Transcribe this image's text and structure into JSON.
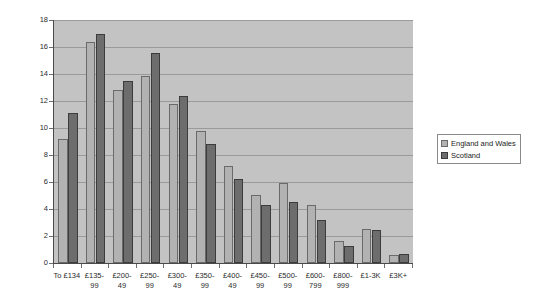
{
  "chart_data": {
    "type": "bar",
    "title": "",
    "xlabel": "",
    "ylabel": "Percentage",
    "ylim": [
      0,
      18
    ],
    "ytick_step": 2,
    "yticks": [
      0,
      2,
      4,
      6,
      8,
      10,
      12,
      14,
      16,
      18
    ],
    "grid": true,
    "legend_position": "right",
    "categories": [
      "To £134",
      "£135-99",
      "£200-49",
      "£250-99",
      "£300-49",
      "£350-99",
      "£400-49",
      "£450-99",
      "£500-99",
      "£600-799",
      "£800-999",
      "£1-3K",
      "£3K+"
    ],
    "category_lines": [
      [
        "To £134",
        ""
      ],
      [
        "£135-",
        "99"
      ],
      [
        "£200-",
        "49"
      ],
      [
        "£250-",
        "99"
      ],
      [
        "£300-",
        "49"
      ],
      [
        "£350-",
        "99"
      ],
      [
        "£400-",
        "49"
      ],
      [
        "£450-",
        "99"
      ],
      [
        "£500-",
        "99"
      ],
      [
        "£600-",
        "799"
      ],
      [
        "£800-",
        "999"
      ],
      [
        "£1-3K",
        ""
      ],
      [
        "£3K+",
        ""
      ]
    ],
    "series": [
      {
        "name": "England and Wales",
        "color": "#b2b2b2",
        "values": [
          9.2,
          16.4,
          12.8,
          13.85,
          11.75,
          9.75,
          7.2,
          5.05,
          5.9,
          4.3,
          1.6,
          2.55,
          0.6
        ]
      },
      {
        "name": "Scotland",
        "color": "#6d6d6d",
        "values": [
          11.1,
          17.0,
          13.5,
          15.55,
          12.35,
          8.85,
          6.2,
          4.3,
          4.5,
          3.15,
          1.25,
          2.45,
          0.7
        ]
      }
    ]
  },
  "legend": {
    "entries": [
      {
        "label": "England and Wales"
      },
      {
        "label": "Scotland"
      }
    ]
  },
  "colors": {
    "plot_background": "#c3c3c3",
    "gridline": "#9a9a9a",
    "axis": "#4a4a4a",
    "series_england_wales": "#b2b2b2",
    "series_scotland": "#6d6d6d"
  }
}
